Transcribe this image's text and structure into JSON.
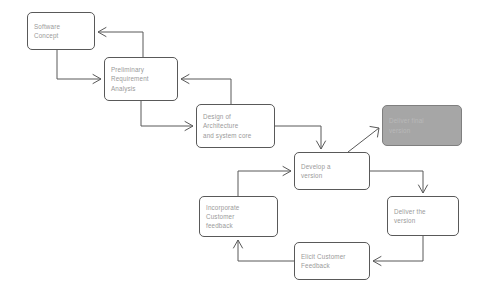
{
  "diagram": {
    "background_color": "#ffffff",
    "node_border_color": "#595959",
    "node_text_color": "#9a9a9a",
    "shaded_node_fill": "#a6a6a6",
    "shaded_node_text_color": "#b9b9b9",
    "edge_color": "#595959",
    "nodes": [
      {
        "id": "software-concept",
        "lines": [
          "Software",
          "Concept"
        ],
        "x": 27,
        "y": 12,
        "w": 68,
        "h": 38,
        "shaded": false
      },
      {
        "id": "preliminary-requirement-analysis",
        "lines": [
          "Preliminary",
          "Requirement",
          "Analysis"
        ],
        "x": 104,
        "y": 57,
        "w": 74,
        "h": 44,
        "shaded": false
      },
      {
        "id": "design-of-architecture-and-system-core",
        "lines": [
          "Design of",
          "Architecture",
          "and system core"
        ],
        "x": 196,
        "y": 104,
        "w": 79,
        "h": 44,
        "shaded": false
      },
      {
        "id": "deliver-final-version",
        "lines": [
          "Deliver final",
          "version"
        ],
        "x": 382,
        "y": 105,
        "w": 80,
        "h": 41,
        "shaded": true
      },
      {
        "id": "develop-a-version",
        "lines": [
          "Develop a",
          "version"
        ],
        "x": 294,
        "y": 152,
        "w": 76,
        "h": 38,
        "shaded": false
      },
      {
        "id": "deliver-the-version",
        "lines": [
          "Deliver the",
          "version"
        ],
        "x": 387,
        "y": 196,
        "w": 72,
        "h": 40,
        "shaded": false
      },
      {
        "id": "incorporate-customer-feedback",
        "lines": [
          "Incorporate",
          "Customer",
          "feedback"
        ],
        "x": 199,
        "y": 196,
        "w": 79,
        "h": 41,
        "shaded": false
      },
      {
        "id": "elicit-customer-feedback",
        "lines": [
          "Elicit Customer",
          "Feedback"
        ],
        "x": 294,
        "y": 242,
        "w": 76,
        "h": 38,
        "shaded": false
      }
    ],
    "edges": [
      {
        "id": "software-concept-to-preliminary",
        "from": "software-concept",
        "to": "preliminary-requirement-analysis",
        "path": "M 57 50 L 57 79 L 101 79",
        "arrow_at": "101,79",
        "arrow_dir": "right"
      },
      {
        "id": "preliminary-to-design",
        "from": "preliminary-requirement-analysis",
        "to": "design-of-architecture-and-system-core",
        "path": "M 141 101 L 141 126 L 193 126",
        "arrow_at": "193,126",
        "arrow_dir": "right"
      },
      {
        "id": "design-to-develop",
        "from": "design-of-architecture-and-system-core",
        "to": "develop-a-version",
        "path": "M 275 126 L 321 126 L 321 149",
        "arrow_at": "321,149",
        "arrow_dir": "down"
      },
      {
        "id": "design-feedback-to-preliminary",
        "from": "design-of-architecture-and-system-core",
        "to": "preliminary-requirement-analysis",
        "path": "M 231 104 L 231 79 L 181 79",
        "arrow_at": "181,79",
        "arrow_dir": "left"
      },
      {
        "id": "preliminary-feedback-to-software-concept",
        "from": "preliminary-requirement-analysis",
        "to": "software-concept",
        "path": "M 143 57 L 143 32 L 98 32",
        "arrow_at": "98,32",
        "arrow_dir": "left"
      },
      {
        "id": "develop-to-deliver-final",
        "from": "develop-a-version",
        "to": "deliver-final-version",
        "path": "M 348 152 L 379 128",
        "arrow_at": "379,128",
        "arrow_dir": "diag-up-right"
      },
      {
        "id": "develop-to-deliver-the-version",
        "from": "develop-a-version",
        "to": "deliver-the-version",
        "path": "M 370 171 L 423 171 L 423 193",
        "arrow_at": "423,193",
        "arrow_dir": "down"
      },
      {
        "id": "deliver-to-elicit-feedback",
        "from": "deliver-the-version",
        "to": "elicit-customer-feedback",
        "path": "M 423 236 L 423 261 L 373 261",
        "arrow_at": "373,261",
        "arrow_dir": "left"
      },
      {
        "id": "elicit-to-incorporate-feedback",
        "from": "elicit-customer-feedback",
        "to": "incorporate-customer-feedback",
        "path": "M 294 261 L 238 261 L 238 240",
        "arrow_at": "238,240",
        "arrow_dir": "up"
      },
      {
        "id": "incorporate-to-develop",
        "from": "incorporate-customer-feedback",
        "to": "develop-a-version",
        "path": "M 238 196 L 238 171 L 291 171",
        "arrow_at": "291,171",
        "arrow_dir": "right"
      }
    ]
  }
}
